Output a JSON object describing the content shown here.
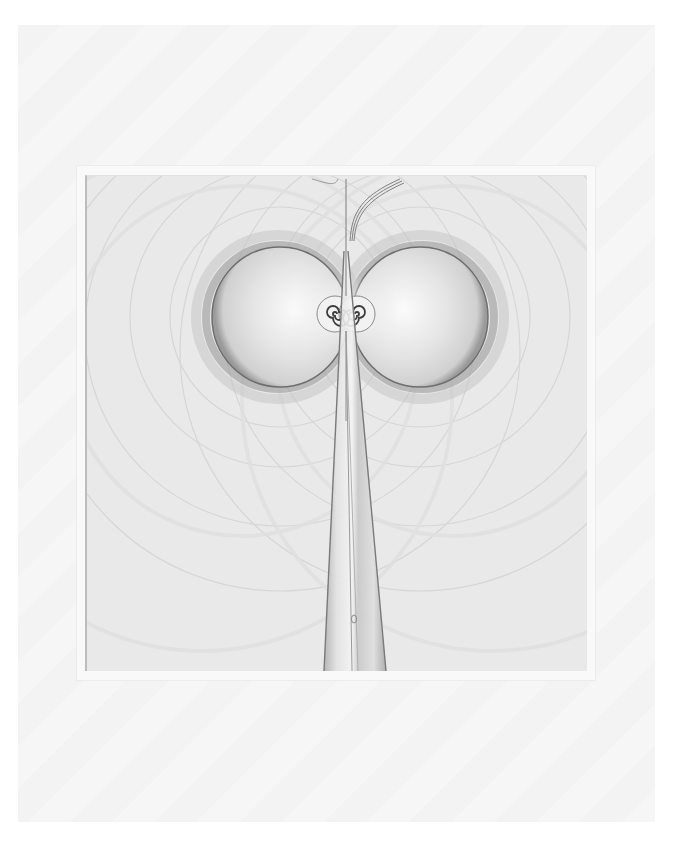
{
  "scene": {
    "description": "Photograph of a framed monochrome print on white paper: a symmetric field-line pattern with two circular lobes, twin spirals at the center, and a tapering vertical stem below",
    "colors": {
      "background": "#ffffff",
      "paper": "#f6f6f6",
      "mat": "#f9f9f9",
      "art_base": "#e9e9e9",
      "ink_dark": "#555555",
      "ink_mid": "#8a8a8a",
      "highlight": "#fafafa"
    }
  },
  "artwork": {
    "lobes": [
      {
        "side": "left",
        "cx": 278,
        "cy": 316,
        "r": 70
      },
      {
        "side": "right",
        "cx": 418,
        "cy": 316,
        "r": 70
      }
    ],
    "spirals": [
      {
        "side": "left",
        "cx": 333,
        "cy": 313
      },
      {
        "side": "right",
        "cx": 355,
        "cy": 313
      }
    ],
    "stem": {
      "top_x": 344,
      "top_y": 178,
      "bottom_left_x": 322,
      "bottom_right_x": 384,
      "bottom_y": 670
    }
  }
}
